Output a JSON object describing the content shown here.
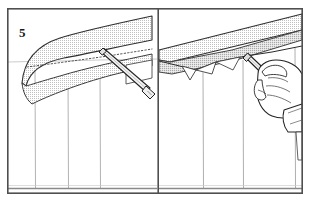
{
  "figure": {
    "kind": "instructional-line-drawing",
    "step_label": "5",
    "panel_count": 2,
    "caption_text": "",
    "width": 310,
    "height": 203
  },
  "colors": {
    "background": "#ffffff",
    "frame_stroke": "#555555",
    "outline_stroke": "#2a2a2a",
    "light_stroke": "#8a8a8a",
    "siding_line": "#9a9a9a",
    "shade_fill": "#d9d9d9",
    "shade_fill_dark": "#c9c9c9",
    "dotted_bead": "#4a4a4a",
    "tool_fill": "#f2f2f2",
    "hand_fill": "#fefefe",
    "text": "#1a1a1a"
  },
  "frame": {
    "x": 7,
    "y": 8,
    "width": 296,
    "height": 186,
    "divider_x": 158,
    "stroke_width": 1.6
  },
  "panels": [
    {
      "id": "panel-left",
      "name": "overview-view",
      "x": 7,
      "y": 8,
      "width": 151,
      "height": 186,
      "description": "Wide view of eave and wall corner with caulking gun nozzle applying a bead along the soffit-to-wall joint",
      "siding_lines_x": [
        35,
        68,
        100
      ],
      "siding_baseline_y": 188,
      "eave_band": {
        "fill": "shade_fill",
        "description": "curved shaded fascia band sloping up to the right"
      },
      "bead_line": {
        "style": "dotted",
        "description": "dotted caulk bead along the joint"
      },
      "tool": {
        "name": "caulking-gun-nozzle",
        "description": "long tapered nozzle angled down-right toward the lower corner"
      }
    },
    {
      "id": "panel-right",
      "name": "detail-view",
      "x": 158,
      "y": 8,
      "width": 145,
      "height": 186,
      "description": "Close-up of a gloved bare hand gripping a caulking gun nozzle, applying sealant into the soffit and wall corner joint",
      "siding_lines_x": [
        203,
        243,
        295
      ],
      "siding_baseline_y": 188,
      "eave_band": {
        "fill": "shade_fill",
        "description": "straight shaded soffit band sloping down to the left"
      },
      "tool": {
        "name": "caulking-gun-nozzle",
        "description": "nozzle held in hand pointed up-left at the joint"
      },
      "hand": {
        "name": "hand-holding-tool",
        "description": "hand with shirt cuff gripping the nozzle body"
      }
    }
  ],
  "annotations": {
    "step_badge_name": "step-number-badge"
  }
}
